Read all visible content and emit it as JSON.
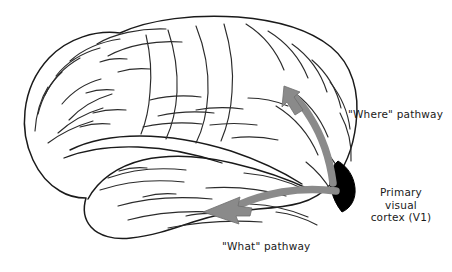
{
  "figure": {
    "background_color": "#ffffff"
  },
  "colors": {
    "outline": "#1a1a1a",
    "sulci": "#2b2b2b",
    "arrow_gray": "#8a8a8a",
    "arrow_gray_stroke": "#6f6f6f",
    "v1_black": "#000000",
    "text": "#1a1a1a"
  },
  "labels": {
    "where_pathway": "\"Where\" pathway",
    "what_pathway": "\"What\" pathway",
    "primary_visual_cortex": {
      "line1": "Primary",
      "line2": "visual",
      "line3": "cortex (V1)"
    }
  },
  "regions": [
    {
      "name": "primary-visual-cortex-v1",
      "fill": "#000000",
      "description": "black crescent wedge at occipital pole"
    }
  ],
  "arrows": [
    {
      "name": "where-pathway-arrow",
      "label": "\"Where\" pathway",
      "direction": "up-left",
      "origin": "occipital pole (V1)",
      "target": "parietal lobe",
      "color": "#8a8a8a"
    },
    {
      "name": "what-pathway-arrow",
      "label": "\"What\" pathway",
      "direction": "left",
      "origin": "occipital pole (V1)",
      "target": "temporal lobe",
      "color": "#8a8a8a"
    }
  ]
}
